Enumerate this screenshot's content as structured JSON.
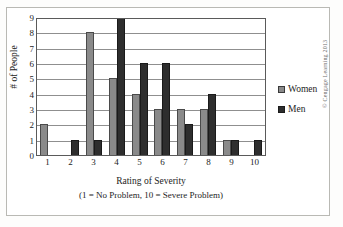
{
  "chart_data": {
    "type": "bar",
    "title": "",
    "categories": [
      "1",
      "2",
      "3",
      "4",
      "5",
      "6",
      "7",
      "8",
      "9",
      "10"
    ],
    "series": [
      {
        "name": "Women",
        "color": "#8a8a8a",
        "values": [
          2,
          0,
          8,
          5,
          4,
          3,
          3,
          3,
          1,
          0
        ]
      },
      {
        "name": "Men",
        "color": "#2e2e2e",
        "values": [
          0,
          1,
          1,
          9,
          6,
          6,
          2,
          4,
          1,
          1
        ]
      }
    ],
    "xlabel": "Rating of Severity",
    "xlabel_note": "(1 = No Problem, 10 = Severe Problem)",
    "ylabel": "# of People",
    "ylim": [
      0,
      9
    ],
    "yticks": [
      0,
      1,
      2,
      3,
      4,
      5,
      6,
      7,
      8,
      9
    ],
    "grid": true,
    "legend_position": "right"
  },
  "legend": {
    "entries": [
      {
        "label": "Women",
        "swatch": "women-swatch"
      },
      {
        "label": "Men",
        "swatch": "men-swatch"
      }
    ]
  },
  "credit": {
    "text": "© Cengage Learning 2013"
  }
}
